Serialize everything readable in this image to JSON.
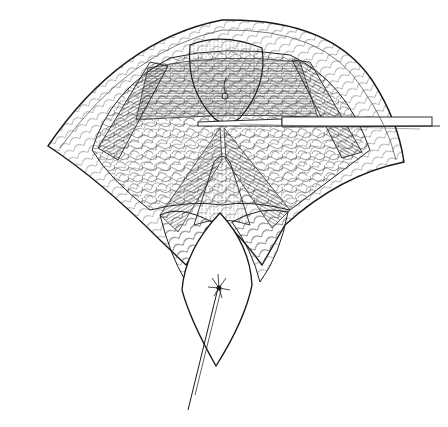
{
  "illustration": {
    "kind": "surgical line drawing",
    "colors": {
      "background": "#ffffff",
      "ink": "#1a1a1a",
      "ink_light": "#5a5a5a",
      "shade": "#e9e9e9"
    }
  }
}
